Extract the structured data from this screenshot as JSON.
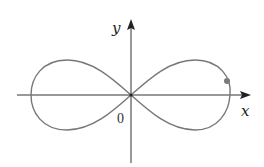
{
  "diagram": {
    "type": "parametric-curve",
    "axes": {
      "x_label": "x",
      "y_label": "y",
      "origin_label": "0"
    },
    "colors": {
      "curve": "#777777",
      "axes": "#333333",
      "point": "#7a7a7a"
    },
    "point": {
      "label": ""
    }
  }
}
